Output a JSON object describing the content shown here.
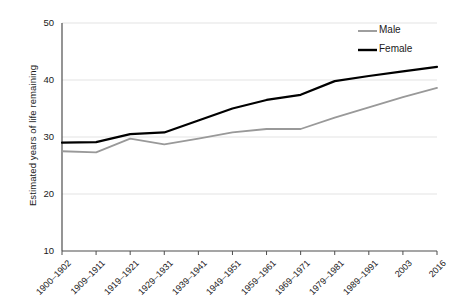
{
  "chart_data": {
    "type": "line",
    "title": "",
    "xlabel": "",
    "ylabel": "Estimated years of life remaining",
    "ylim": [
      10,
      50
    ],
    "yticks": [
      10,
      20,
      30,
      40,
      50
    ],
    "grid": true,
    "legend_position": "top-right",
    "categories": [
      "1900–1902",
      "1909–1911",
      "1919–1921",
      "1929–1931",
      "1939–1941",
      "1949–1951",
      "1959–1961",
      "1969–1971",
      "1979–1981",
      "1989–1991",
      "2003",
      "2016"
    ],
    "series": [
      {
        "name": "Male",
        "color": "#999999",
        "values": [
          27.5,
          27.3,
          29.7,
          28.7,
          29.7,
          30.8,
          31.4,
          31.4,
          33.4,
          35.2,
          37.0,
          38.6
        ]
      },
      {
        "name": "Female",
        "color": "#000000",
        "values": [
          29.0,
          29.1,
          30.5,
          30.8,
          32.9,
          35.0,
          36.5,
          37.4,
          39.8,
          40.7,
          41.5,
          42.3
        ]
      }
    ]
  },
  "legend": {
    "items": [
      {
        "label": "Male"
      },
      {
        "label": "Female"
      }
    ]
  },
  "axes": {
    "y_title": "Estimated years of life remaining",
    "y_labels": [
      "50",
      "40",
      "30",
      "20",
      "10"
    ]
  }
}
